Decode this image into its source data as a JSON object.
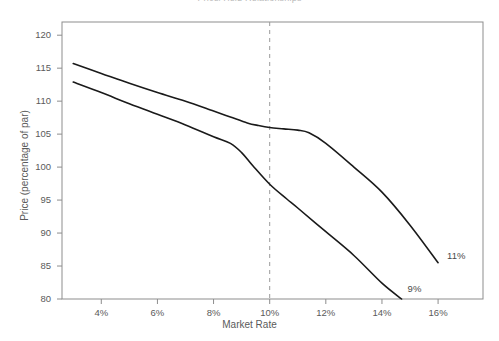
{
  "chart_data": {
    "type": "line",
    "title": "Price/Yield Relationships",
    "xlabel": "Market Rate",
    "ylabel": "Price (percentage of par)",
    "xlim": [
      2.6,
      17.6
    ],
    "ylim": [
      80,
      122
    ],
    "grid": false,
    "legend_position": "inline-right-end",
    "x_ticks": [
      "4%",
      "6%",
      "8%",
      "10%",
      "12%",
      "14%",
      "16%"
    ],
    "x_tick_values": [
      4,
      6,
      8,
      10,
      12,
      14,
      16
    ],
    "y_ticks": [
      "80",
      "85",
      "90",
      "95",
      "100",
      "105",
      "110",
      "115",
      "120"
    ],
    "y_tick_values": [
      80,
      85,
      90,
      95,
      100,
      105,
      110,
      115,
      120
    ],
    "annotations": [
      {
        "text": "10% reference",
        "type": "vline",
        "x": 10,
        "style": "dashed",
        "color": "#9a9a9a"
      }
    ],
    "series": [
      {
        "name": "11%",
        "label": "11%",
        "color": "#1a1a1a",
        "x": [
          3.0,
          4.0,
          5.0,
          6.0,
          7.0,
          8.0,
          8.6,
          9.2,
          9.6,
          10.0,
          10.5,
          11.0,
          11.4,
          12.0,
          13.0,
          14.0,
          15.0,
          16.0
        ],
        "y": [
          115.7,
          114.2,
          112.7,
          111.3,
          110.0,
          108.5,
          107.6,
          106.7,
          106.3,
          106.0,
          105.8,
          105.6,
          105.2,
          103.6,
          100.0,
          96.2,
          91.2,
          85.5
        ]
      },
      {
        "name": "9%",
        "label": "9%",
        "color": "#1a1a1a",
        "x": [
          3.0,
          4.0,
          5.0,
          6.0,
          7.0,
          8.0,
          8.6,
          9.0,
          9.4,
          10.0,
          10.6,
          11.0,
          12.0,
          13.0,
          14.0,
          14.7
        ],
        "y": [
          112.9,
          111.3,
          109.6,
          108.0,
          106.4,
          104.6,
          103.6,
          102.2,
          100.2,
          97.4,
          95.2,
          93.8,
          90.2,
          86.6,
          82.4,
          80.0
        ]
      }
    ]
  },
  "frame": {
    "color": "#8d8d8d",
    "left": 62,
    "right": 483,
    "top": 22,
    "bottom": 299
  }
}
